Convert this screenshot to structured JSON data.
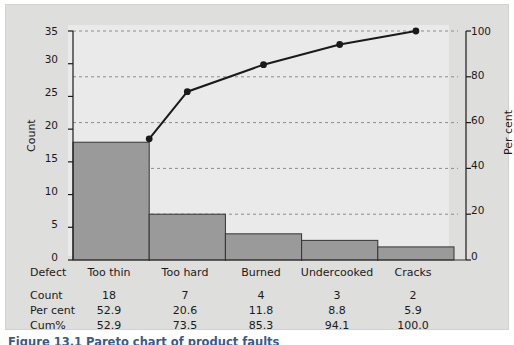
{
  "figure": {
    "caption": "Figure 13.1 Pareto chart of product faults",
    "panel_color": "#dededd",
    "plot_bg_color": "#eaeaea",
    "bar_fill_color": "#9a9a9a",
    "bar_border_color": "#333333",
    "line_color": "#1a1a1a",
    "grid_color": "#8c8c8c"
  },
  "chart_data": {
    "type": "bar",
    "title": "",
    "xlabel": "Defect",
    "ylabel": "Count",
    "y2label": "Per cent",
    "categories": [
      "Too thin",
      "Too hard",
      "Burned",
      "Undercooked",
      "Cracks"
    ],
    "values": [
      18,
      7,
      4,
      3,
      2
    ],
    "series": [
      {
        "name": "Count",
        "type": "bar",
        "axis": "left",
        "values": [
          18,
          7,
          4,
          3,
          2
        ]
      },
      {
        "name": "Cum%",
        "type": "line",
        "axis": "right",
        "values": [
          52.9,
          73.5,
          85.3,
          94.1,
          100.0
        ]
      }
    ],
    "ylim": [
      0,
      35
    ],
    "yticks": [
      0,
      5,
      10,
      15,
      20,
      25,
      30,
      35
    ],
    "y2lim": [
      0,
      100
    ],
    "y2ticks": [
      0,
      20,
      40,
      60,
      80,
      100
    ],
    "grid": true,
    "legend": "none"
  },
  "axes": {
    "left_ticks": [
      "35",
      "30",
      "25",
      "20",
      "15",
      "10",
      "5",
      "0"
    ],
    "right_ticks": [
      "100",
      "80",
      "60",
      "40",
      "20",
      "0"
    ],
    "left_title": "Count",
    "right_title": "Per cent"
  },
  "table": {
    "header_label": "Defect",
    "categories": [
      "Too thin",
      "Too hard",
      "Burned",
      "Undercooked",
      "Cracks"
    ],
    "rows": [
      {
        "label": "Count",
        "values": [
          "18",
          "7",
          "4",
          "3",
          "2"
        ]
      },
      {
        "label": "Per cent",
        "values": [
          "52.9",
          "20.6",
          "11.8",
          "8.8",
          "5.9"
        ]
      },
      {
        "label": "Cum%",
        "values": [
          "52.9",
          "73.5",
          "85.3",
          "94.1",
          "100.0"
        ]
      }
    ]
  }
}
